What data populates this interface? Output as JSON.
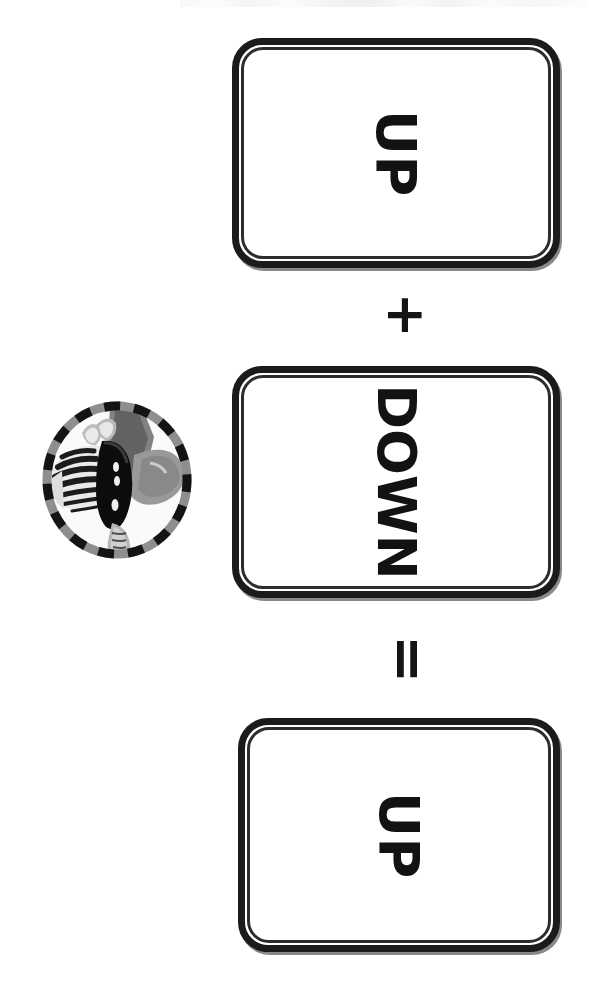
{
  "canvas": {
    "width": 590,
    "height": 992,
    "background": "#ffffff",
    "orientation": "rotated-90-clockwise",
    "ink_color": "#141414"
  },
  "equation": {
    "description": "Keyboard key equation reading UP plus DOWN equals UP",
    "keys": [
      {
        "id": "key-up-1",
        "label": "UP"
      },
      {
        "id": "key-down",
        "label": "DOWN"
      },
      {
        "id": "key-up-2",
        "label": "UP"
      }
    ],
    "operators": [
      {
        "id": "op-plus",
        "symbol": "+",
        "name": "plus-sign"
      },
      {
        "id": "op-equals",
        "symbol": "=",
        "name": "equals-sign"
      }
    ]
  },
  "badge": {
    "name": "zebra-head-badge",
    "shape": "circle",
    "border_style": "dashed",
    "border_colors": [
      "#141414",
      "#8e8e8e"
    ],
    "subject": "zebra head",
    "palette": {
      "stripe_dark": "#1a1a1a",
      "stripe_light": "#f2f2f2",
      "muzzle_gray": "#9a9a9a",
      "mane_gray": "#6f6f6f",
      "ear_gray": "#b5b5b5"
    }
  }
}
